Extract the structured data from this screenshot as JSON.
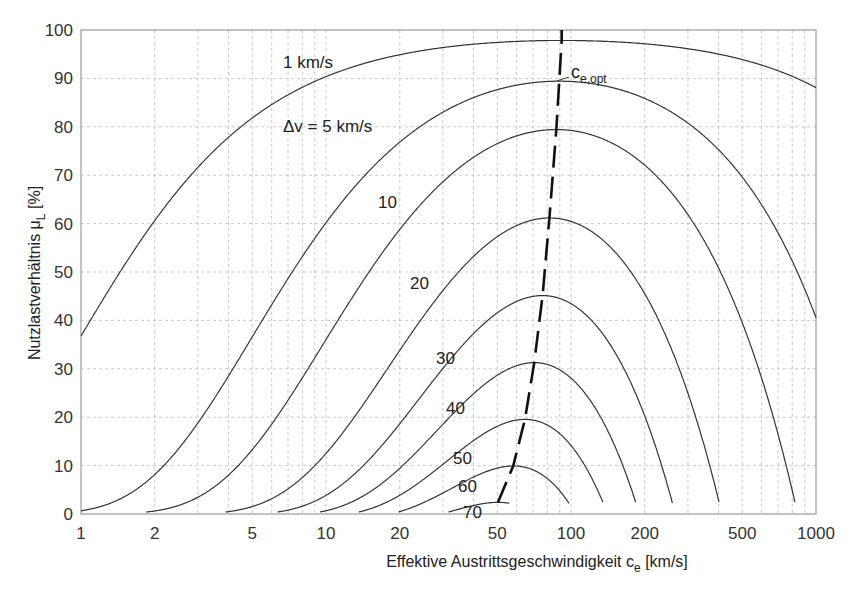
{
  "chart_data": {
    "type": "line",
    "title": "",
    "xlabel": "Effektive Austrittsgeschwindigkeit c_e [km/s]",
    "ylabel": "Nutzlastverhältnis μ_L [%]",
    "xscale": "log",
    "xlim": [
      1,
      1000
    ],
    "ylim": [
      0,
      100
    ],
    "x_ticks": [
      1,
      2,
      5,
      10,
      20,
      50,
      100,
      200,
      500,
      1000
    ],
    "y_ticks": [
      0,
      10,
      20,
      30,
      40,
      50,
      60,
      70,
      80,
      90,
      100
    ],
    "grid": true,
    "model": "mu = exp(-dv/c) - (1 - exp(-dv/c)) * (c/c_star)^2",
    "c_star": 92,
    "series": [
      {
        "name": "1 km/s",
        "dv": 1,
        "label": "1 km/s",
        "peak_pct": 98,
        "peak_c": 90
      },
      {
        "name": "Δv = 5 km/s",
        "dv": 5,
        "label": "Δv = 5 km/s",
        "peak_pct": 90,
        "peak_c": 85
      },
      {
        "name": "10",
        "dv": 10,
        "label": "10",
        "peak_pct": 80,
        "peak_c": 82
      },
      {
        "name": "20",
        "dv": 20,
        "label": "20",
        "peak_pct": 61,
        "peak_c": 77
      },
      {
        "name": "30",
        "dv": 30,
        "label": "30",
        "peak_pct": 45,
        "peak_c": 73
      },
      {
        "name": "40",
        "dv": 40,
        "label": "40",
        "peak_pct": 31,
        "peak_c": 69
      },
      {
        "name": "50",
        "dv": 50,
        "label": "50",
        "peak_pct": 19,
        "peak_c": 65
      },
      {
        "name": "60",
        "dv": 60,
        "label": "60",
        "peak_pct": 10,
        "peak_c": 60
      },
      {
        "name": "70",
        "dv": 70,
        "label": "70",
        "peak_pct": 2,
        "peak_c": 50
      }
    ],
    "annotations": [
      {
        "text": "c",
        "sub": "e,opt",
        "meaning": "optimal exhaust velocity (dashed line)"
      }
    ]
  },
  "labels": {
    "xlabel_main": "Effektive Austrittsgeschwindigkeit c",
    "xlabel_sub": "e",
    "xlabel_unit": " [km/s]",
    "ylabel_main": "Nutzlastverhältnis μ",
    "ylabel_sub": "L",
    "ylabel_unit": " [%]",
    "ceopt_main": "c",
    "ceopt_sub": "e,opt"
  }
}
